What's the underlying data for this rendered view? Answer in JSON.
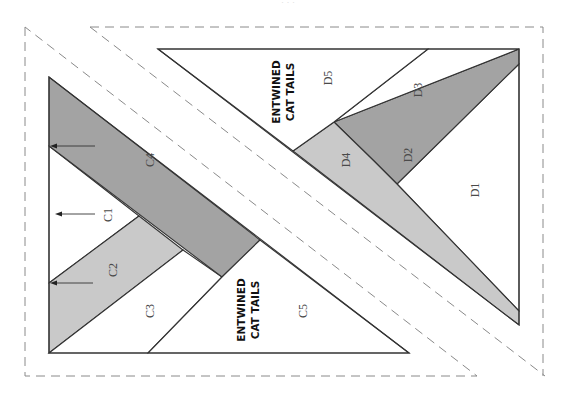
{
  "diagram": {
    "type": "quilt-foundation-pattern",
    "colors": {
      "background": "#ffffff",
      "white_piece": "#ffffff",
      "light_gray": "#c9c9c9",
      "dark_gray": "#a3a3a3",
      "outline": "#333333",
      "dashed": "#8a8a8a"
    },
    "section_c": {
      "title_line1": "ENTWINED",
      "title_line2": "CAT TAILS",
      "seam_allowance": "25,27 25,376 477,376",
      "outline": "49,77 49,353 409,353",
      "pieces": [
        {
          "id": "C1",
          "label": "C1",
          "fill": "white",
          "points": "49,146 139,216 49,283",
          "label_x": 108,
          "label_y": 215
        },
        {
          "id": "C2",
          "label": "C2",
          "fill": "light_gray",
          "points": "49,283 139,216 183,250 49,353",
          "label_x": 113,
          "label_y": 270
        },
        {
          "id": "C3",
          "label": "C3",
          "fill": "white",
          "points": "49,353 183,250 222,277 148,353",
          "label_x": 150,
          "label_y": 311
        },
        {
          "id": "C4",
          "label": "C4",
          "fill": "dark_gray",
          "points": "49,77 260,240 222,277 49,146",
          "label_x": 150,
          "label_y": 160
        },
        {
          "id": "C5",
          "label": "C5",
          "fill": "white",
          "points": "222,277 260,240 409,353 148,353",
          "label_x": 303,
          "label_y": 311
        }
      ],
      "arrows": [
        {
          "y": 146,
          "x1": 95,
          "x2": 50
        },
        {
          "y": 214,
          "x1": 95,
          "x2": 55
        },
        {
          "y": 283,
          "x1": 93,
          "x2": 50
        }
      ],
      "title_x": 248,
      "title_y": 310
    },
    "section_d": {
      "title_line1": "ENTWINED",
      "title_line2": "CAT TAILS",
      "seam_allowance": "90,27 543,27 543,376",
      "outline": "158,49 519,49 519,325",
      "pieces": [
        {
          "id": "D1",
          "label": "D1",
          "fill": "white",
          "points": "397,184 519,64 519,311",
          "label_x": 475,
          "label_y": 190
        },
        {
          "id": "D2",
          "label": "D2",
          "fill": "dark_gray",
          "points": "334,122 519,49 519,64 397,184 374,161",
          "label_x": 408,
          "label_y": 155
        },
        {
          "id": "D3",
          "label": "D3",
          "fill": "white",
          "points": "428,49 519,49 334,122",
          "label_x": 418,
          "label_y": 90
        },
        {
          "id": "D4",
          "label": "D4",
          "fill": "light_gray",
          "points": "293,151 334,122 374,161 397,184 519,311 519,325",
          "label_x": 346,
          "label_y": 160
        },
        {
          "id": "D5",
          "label": "D5",
          "fill": "white",
          "points": "158,49 428,49 334,122 293,151",
          "label_x": 328,
          "label_y": 78
        }
      ],
      "title_x": 283,
      "title_y": 92
    },
    "faint_header": "· · ·"
  }
}
